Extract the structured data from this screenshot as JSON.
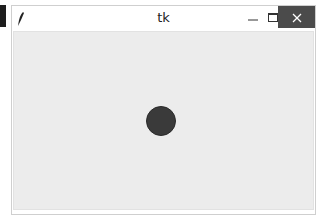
{
  "window": {
    "title": "tk",
    "icon": "tk-feather-icon",
    "controls": {
      "minimize": "minimize-icon",
      "maximize": "maximize-icon",
      "close": "close-icon",
      "close_color": "#4b4b4b"
    }
  },
  "canvas": {
    "background": "#ececec",
    "shapes": [
      {
        "type": "oval",
        "fill": "#3a3a3a",
        "x": 144,
        "y": 105,
        "width": 30,
        "height": 30
      }
    ]
  }
}
